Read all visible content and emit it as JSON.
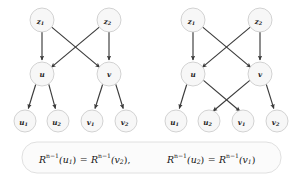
{
  "figure": {
    "title": "",
    "background_color": "#ffffff",
    "node_fill": "#f7f7f7",
    "node_stroke": "#c8c8c8",
    "edge_color": "#3b3b3b",
    "graphs": [
      {
        "id": "left-graph",
        "name": "left-graph",
        "nodes": [
          {
            "id": "z1",
            "label": "z",
            "sub": "1",
            "x": 42,
            "y": 20,
            "r": 12
          },
          {
            "id": "z2",
            "label": "z",
            "sub": "2",
            "x": 109,
            "y": 20,
            "r": 12
          },
          {
            "id": "u",
            "label": "u",
            "sub": "",
            "x": 42,
            "y": 74,
            "r": 12
          },
          {
            "id": "v",
            "label": "v",
            "sub": "",
            "x": 109,
            "y": 74,
            "r": 12
          },
          {
            "id": "u1",
            "label": "u",
            "sub": "1",
            "x": 25,
            "y": 121,
            "r": 11
          },
          {
            "id": "u2",
            "label": "u",
            "sub": "2",
            "x": 58,
            "y": 121,
            "r": 11
          },
          {
            "id": "v1",
            "label": "v",
            "sub": "1",
            "x": 92,
            "y": 121,
            "r": 11
          },
          {
            "id": "v2",
            "label": "v",
            "sub": "2",
            "x": 126,
            "y": 121,
            "r": 11
          }
        ],
        "edges": [
          {
            "from": "z1",
            "to": "u"
          },
          {
            "from": "z1",
            "to": "v"
          },
          {
            "from": "z2",
            "to": "u"
          },
          {
            "from": "z2",
            "to": "v"
          },
          {
            "from": "u",
            "to": "u1"
          },
          {
            "from": "u",
            "to": "u2"
          },
          {
            "from": "v",
            "to": "v1"
          },
          {
            "from": "v",
            "to": "v2"
          }
        ]
      },
      {
        "id": "right-graph",
        "name": "right-graph",
        "nodes": [
          {
            "id": "z1",
            "label": "z",
            "sub": "1",
            "x": 193,
            "y": 20,
            "r": 12
          },
          {
            "id": "z2",
            "label": "z",
            "sub": "2",
            "x": 260,
            "y": 20,
            "r": 12
          },
          {
            "id": "u",
            "label": "u",
            "sub": "",
            "x": 193,
            "y": 74,
            "r": 12
          },
          {
            "id": "v",
            "label": "v",
            "sub": "",
            "x": 260,
            "y": 74,
            "r": 12
          },
          {
            "id": "u1",
            "label": "u",
            "sub": "1",
            "x": 176,
            "y": 121,
            "r": 11
          },
          {
            "id": "u2",
            "label": "u",
            "sub": "2",
            "x": 209,
            "y": 121,
            "r": 11
          },
          {
            "id": "v1",
            "label": "v",
            "sub": "1",
            "x": 243,
            "y": 121,
            "r": 11
          },
          {
            "id": "v2",
            "label": "v",
            "sub": "2",
            "x": 277,
            "y": 121,
            "r": 11
          }
        ],
        "edges": [
          {
            "from": "z1",
            "to": "u"
          },
          {
            "from": "z1",
            "to": "v"
          },
          {
            "from": "z2",
            "to": "u"
          },
          {
            "from": "z2",
            "to": "v"
          },
          {
            "from": "u",
            "to": "u1"
          },
          {
            "from": "u",
            "to": "v1"
          },
          {
            "from": "v",
            "to": "u2"
          },
          {
            "from": "v",
            "to": "v2"
          }
        ]
      }
    ],
    "formula": {
      "box": {
        "x": 22,
        "y": 142,
        "width": 259,
        "height": 31,
        "radius": 15
      },
      "parts": [
        {
          "id": "eq1",
          "name": "formula-equation-1",
          "base": "R",
          "sup": "n−1",
          "arg": "(u",
          "argsub": "1",
          "argclose": ")",
          "rel": "=",
          "rbase": "R",
          "rsup": "n−1",
          "rarg": "(v",
          "rargsub": "2",
          "rargclose": ")",
          "tail": ","
        },
        {
          "id": "eq2",
          "name": "formula-equation-2",
          "base": "R",
          "sup": "n−1",
          "arg": "(u",
          "argsub": "2",
          "argclose": ")",
          "rel": "=",
          "rbase": "R",
          "rsup": "n−1",
          "rarg": "(v",
          "rargsub": "1",
          "rargclose": ")",
          "tail": ""
        }
      ],
      "plain_text": "R^{n−1}(u₁) = R^{n−1}(v₂),   R^{n−1}(u₂) = R^{n−1}(v₁)"
    }
  }
}
